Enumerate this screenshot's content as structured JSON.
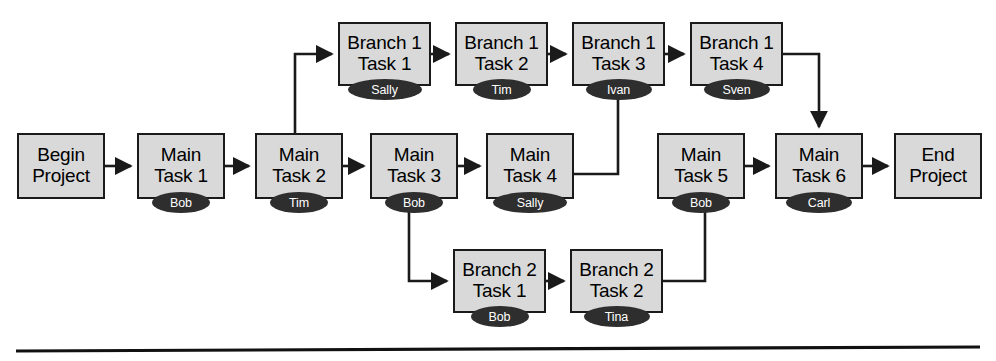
{
  "diagram": {
    "colors": {
      "node_fill": "#d9d9d9",
      "node_border": "#1a1a1a",
      "badge_fill": "#2e2e2e",
      "badge_text": "#ffffff",
      "edge": "#1a1a1a",
      "background": "#ffffff"
    },
    "nodes": [
      {
        "id": "begin",
        "line1": "Begin",
        "line2": "Project",
        "owner": null,
        "x": 17,
        "y": 133,
        "w": 88,
        "h": 66
      },
      {
        "id": "main1",
        "line1": "Main",
        "line2": "Task 1",
        "owner": "Bob",
        "x": 137,
        "y": 133,
        "w": 88,
        "h": 66
      },
      {
        "id": "main2",
        "line1": "Main",
        "line2": "Task 2",
        "owner": "Tim",
        "x": 255,
        "y": 133,
        "w": 88,
        "h": 66
      },
      {
        "id": "main3",
        "line1": "Main",
        "line2": "Task 3",
        "owner": "Bob",
        "x": 370,
        "y": 133,
        "w": 88,
        "h": 66
      },
      {
        "id": "main4",
        "line1": "Main",
        "line2": "Task 4",
        "owner": "Sally",
        "x": 486,
        "y": 133,
        "w": 88,
        "h": 66
      },
      {
        "id": "main5",
        "line1": "Main",
        "line2": "Task 5",
        "owner": "Bob",
        "x": 657,
        "y": 133,
        "w": 88,
        "h": 66
      },
      {
        "id": "main6",
        "line1": "Main",
        "line2": "Task 6",
        "owner": "Carl",
        "x": 775,
        "y": 133,
        "w": 88,
        "h": 66
      },
      {
        "id": "end",
        "line1": "End",
        "line2": "Project",
        "owner": null,
        "x": 894,
        "y": 133,
        "w": 88,
        "h": 66
      },
      {
        "id": "b1t1",
        "line1": "Branch 1",
        "line2": "Task 1",
        "owner": "Sally",
        "x": 338,
        "y": 22,
        "w": 93,
        "h": 64
      },
      {
        "id": "b1t2",
        "line1": "Branch 1",
        "line2": "Task 2",
        "owner": "Tim",
        "x": 455,
        "y": 22,
        "w": 93,
        "h": 64
      },
      {
        "id": "b1t3",
        "line1": "Branch 1",
        "line2": "Task 3",
        "owner": "Ivan",
        "x": 572,
        "y": 22,
        "w": 93,
        "h": 64
      },
      {
        "id": "b1t4",
        "line1": "Branch 1",
        "line2": "Task 4",
        "owner": "Sven",
        "x": 690,
        "y": 22,
        "w": 93,
        "h": 64
      },
      {
        "id": "b2t1",
        "line1": "Branch 2",
        "line2": "Task 1",
        "owner": "Bob",
        "x": 453,
        "y": 249,
        "w": 93,
        "h": 64
      },
      {
        "id": "b2t2",
        "line1": "Branch 2",
        "line2": "Task 2",
        "owner": "Tina",
        "x": 570,
        "y": 249,
        "w": 93,
        "h": 64
      }
    ],
    "edges": [
      {
        "id": "begin-main1",
        "from": "begin",
        "to": "main1",
        "kind": "straight-right"
      },
      {
        "id": "main1-main2",
        "from": "main1",
        "to": "main2",
        "kind": "straight-right"
      },
      {
        "id": "main2-main3",
        "from": "main2",
        "to": "main3",
        "kind": "straight-right"
      },
      {
        "id": "main3-main4",
        "from": "main3",
        "to": "main4",
        "kind": "straight-right"
      },
      {
        "id": "main5-main6",
        "from": "main5",
        "to": "main6",
        "kind": "straight-right"
      },
      {
        "id": "main6-end",
        "from": "main6",
        "to": "end",
        "kind": "straight-right"
      },
      {
        "id": "b1t1-b1t2",
        "from": "b1t1",
        "to": "b1t2",
        "kind": "straight-right"
      },
      {
        "id": "b1t2-b1t3",
        "from": "b1t2",
        "to": "b1t3",
        "kind": "straight-right"
      },
      {
        "id": "b1t3-b1t4",
        "from": "b1t3",
        "to": "b1t4",
        "kind": "straight-right"
      },
      {
        "id": "b2t1-b2t2",
        "from": "b2t1",
        "to": "b2t2",
        "kind": "straight-right"
      },
      {
        "id": "main2-b1t1",
        "from": "main2",
        "to": "b1t1",
        "kind": "up-then-right"
      },
      {
        "id": "b1t4-main6",
        "from": "b1t4",
        "to": "main6",
        "kind": "right-then-down"
      },
      {
        "id": "b1t3-main4",
        "from": "b1t3",
        "to": "main4",
        "kind": "down-then-left"
      },
      {
        "id": "main3-b2t1",
        "from": "main3",
        "to": "b2t1",
        "kind": "down-then-right"
      },
      {
        "id": "b2t2-main5",
        "from": "b2t2",
        "to": "main5",
        "kind": "right-then-up"
      }
    ],
    "divider": {
      "label": "bottom-rule",
      "y": 349
    }
  }
}
